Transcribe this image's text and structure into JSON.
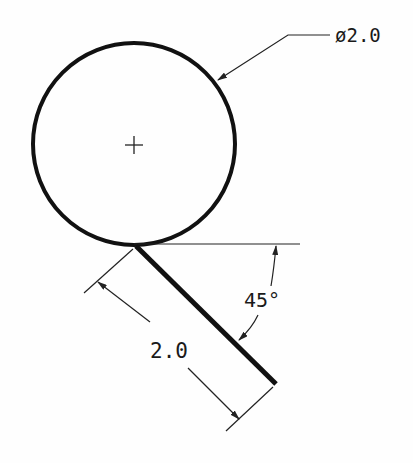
{
  "drawing": {
    "diameter_label": "ø2.0",
    "length_label": "2.0",
    "angle_label": "45°",
    "center_mark": "+",
    "colors": {
      "geometry": "#111111",
      "dimension": "#222222",
      "background": "#fefefe"
    }
  }
}
